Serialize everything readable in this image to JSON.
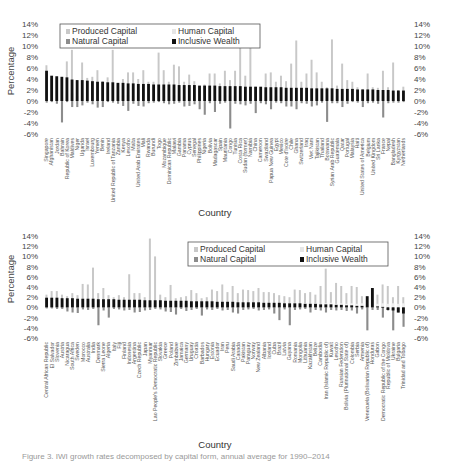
{
  "colors": {
    "produced": "#c8c8c8",
    "human": "#f0f0f0",
    "natural": "#8c8c8c",
    "inclusive": "#111111"
  },
  "legend": {
    "produced": "Produced Capital",
    "human": "Human Capital",
    "natural": "Natural Capital",
    "inclusive": "Inclusive Wealth"
  },
  "caption": "Figure 3. IWI growth rates decomposed by capital form, annual average for 1990–2014",
  "chart_data": [
    {
      "type": "bar",
      "title": "",
      "xlabel": "Country",
      "ylabel": "Percentage",
      "ylim": [
        -6,
        14
      ],
      "yticks": [
        "14%",
        "12%",
        "10%",
        "8%",
        "6%",
        "4%",
        "2%",
        "0%",
        "-2%",
        "-4%",
        "-6%"
      ],
      "legend_position": "top-center",
      "grid": false,
      "categories": [
        "Singapore",
        "Afghanistan",
        "Jordan",
        "Bahrain",
        "Republic of Korea",
        "Maldives",
        "Niger",
        "Uganda",
        "Israel",
        "Luxembourg",
        "Yemen",
        "Benin",
        "Ireland",
        "United Republic of Tanzania",
        "Zambia",
        "Kenya",
        "Lesotho",
        "Malta",
        "United Arab Emirates",
        "Mali",
        "Rwanda",
        "Burundi",
        "Togo",
        "Mozambique",
        "Dominican Republic",
        "Malawi",
        "Gambia",
        "Panama",
        "Cyprus",
        "Senegal",
        "Philippines",
        "Nigeria",
        "Bolivia",
        "Madagascar",
        "Spain",
        "Mauritania",
        "Congo",
        "Tunisia",
        "Costa Rica",
        "Sudan (former)",
        "Namibia",
        "China",
        "Cameroon",
        "Swaziland",
        "Papua New Guinea",
        "Egypt",
        "Mexico",
        "Cote d'Ivoire",
        "Chile",
        "Ghana",
        "Switzerland",
        "Iraq",
        "Viet Nam",
        "Tajikistan",
        "Thailand",
        "Botswana",
        "Syrian Arab Republic",
        "Guatemala",
        "Qatar",
        "Portugal",
        "Malaysia",
        "Haiti",
        "United States of America",
        "Belgium",
        "United Kingdom",
        "Sri Lanka",
        "France",
        "Nepal",
        "Bangladesh",
        "Kyrgyzstan",
        "Netherlands"
      ],
      "series": [
        {
          "name": "Inclusive Wealth",
          "values": [
            5.5,
            4.6,
            4.5,
            4.4,
            4.3,
            3.9,
            3.8,
            3.8,
            3.7,
            3.6,
            3.5,
            3.5,
            3.4,
            3.4,
            3.3,
            3.3,
            3.2,
            3.2,
            3.1,
            3.1,
            3.1,
            3.0,
            3.0,
            3.0,
            3.0,
            3.0,
            2.9,
            2.9,
            2.9,
            2.9,
            2.8,
            2.8,
            2.8,
            2.8,
            2.7,
            2.7,
            2.7,
            2.7,
            2.7,
            2.6,
            2.6,
            2.6,
            2.6,
            2.5,
            2.5,
            2.5,
            2.5,
            2.4,
            2.4,
            2.4,
            2.4,
            2.4,
            2.3,
            2.3,
            2.3,
            2.3,
            2.3,
            2.2,
            2.2,
            2.2,
            2.2,
            2.1,
            2.1,
            2.1,
            2.1,
            2.0,
            2.0,
            2.0,
            1.9,
            1.9,
            1.9
          ]
        },
        {
          "name": "Produced Capital",
          "values": [
            6.5,
            4.0,
            4.2,
            4.0,
            7.2,
            9.3,
            3.8,
            7.0,
            4.2,
            4.4,
            5.6,
            3.6,
            4.3,
            9.3,
            3.0,
            4.0,
            5.2,
            5.2,
            4.0,
            5.6,
            3.5,
            3.5,
            8.8,
            5.6,
            3.5,
            6.6,
            6.3,
            3.5,
            4.8,
            3.6,
            2.5,
            3.0,
            5.0,
            5.0,
            3.2,
            5.5,
            3.8,
            5.5,
            11.8,
            4.6,
            11.0,
            2.6,
            2.0,
            5.0,
            5.2,
            3.5,
            4.6,
            3.6,
            6.8,
            11.0,
            3.5,
            5.0,
            7.5,
            5.2,
            3.5,
            2.5,
            11.2,
            2.8,
            6.8,
            3.8,
            3.5,
            2.5,
            2.2,
            5.0,
            2.5,
            2.4,
            5.5,
            2.5,
            7.0,
            2.0,
            2.6
          ]
        },
        {
          "name": "Human Capital",
          "values": [
            1.0,
            0.8,
            0.9,
            0.7,
            1.2,
            1.4,
            0.9,
            1.0,
            0.8,
            1.1,
            1.0,
            0.9,
            1.3,
            0.8,
            0.9,
            1.0,
            1.1,
            0.9,
            0.8,
            1.2,
            1.0,
            0.9,
            0.8,
            1.0,
            0.9,
            1.1,
            1.0,
            0.8,
            1.0,
            0.9,
            1.0,
            1.2,
            0.9,
            0.8,
            1.0,
            1.1,
            0.9,
            1.0,
            0.8,
            1.0,
            0.9,
            1.0,
            1.0,
            0.8,
            1.0,
            0.9,
            1.0,
            1.0,
            0.9,
            1.0,
            0.9,
            1.0,
            0.8,
            1.0,
            0.9,
            1.0,
            1.0,
            0.9,
            1.0,
            0.9,
            1.0,
            0.9,
            1.0,
            0.8,
            1.0,
            0.9,
            1.0,
            0.9,
            1.0,
            0.9,
            1.0
          ]
        },
        {
          "name": "Natural Capital",
          "values": [
            -0.3,
            -0.2,
            -0.5,
            -3.9,
            -0.2,
            -1.1,
            -1.1,
            -0.8,
            -0.3,
            -0.6,
            -1.2,
            -1.1,
            -0.2,
            -0.3,
            -0.5,
            -0.9,
            -1.8,
            -0.5,
            -0.9,
            -1.0,
            -0.4,
            -0.3,
            -0.2,
            -0.4,
            -0.6,
            -0.5,
            -0.3,
            -1.0,
            -0.9,
            -0.6,
            -1.5,
            -2.5,
            -0.4,
            -2.0,
            -0.5,
            -0.3,
            -5.0,
            -0.5,
            -0.6,
            -0.8,
            -0.5,
            -2.2,
            -0.4,
            -0.6,
            -1.5,
            -0.3,
            -0.4,
            -1.0,
            -1.0,
            -1.5,
            -0.4,
            -0.5,
            -1.0,
            -0.8,
            -0.3,
            -3.8,
            -0.4,
            -0.4,
            -1.1,
            -0.5,
            -0.2,
            -0.3,
            -1.1,
            -0.4,
            -0.3,
            -0.5,
            -3.0,
            -0.4,
            -0.3,
            -0.3,
            -0.2
          ]
        }
      ]
    },
    {
      "type": "bar",
      "title": "",
      "xlabel": "Country",
      "ylabel": "Percentage",
      "ylim": [
        -6,
        14
      ],
      "yticks": [
        "14%",
        "12%",
        "10%",
        "8%",
        "6%",
        "4%",
        "2%",
        "0%",
        "-2%",
        "-4%",
        "-6%"
      ],
      "legend_position": "top-right",
      "grid": false,
      "categories": [
        "Central African Republic",
        "El Salvador",
        "Slovenia",
        "Austria",
        "Nicaragua",
        "South Africa",
        "Sweden",
        "Morocco",
        "Australia",
        "India",
        "Denmark",
        "Sierra Leone",
        "Algeria",
        "Italy",
        "Fiji",
        "Finland",
        "Indonesia",
        "Argentina",
        "Czech Republic",
        "Japan",
        "Myanmar",
        "Lao People's Democratic Republic",
        "Slovakia",
        "Greece",
        "Poland",
        "Zimbabwe",
        "Jamaica",
        "Germany",
        "Uruguay",
        "Croatia",
        "Barbados",
        "Hungary",
        "Estonia",
        "Ecuador",
        "Iran",
        "Peru",
        "Saudi Arabia",
        "Canada",
        "Pakistan",
        "Paraguay",
        "Norway",
        "New Zealand",
        "Albania",
        "Iceland",
        "Cuba",
        "Brazil",
        "Latvia",
        "Guyana",
        "Romania",
        "Mongolia",
        "Lithuania",
        "Kazakhstan",
        "Belize",
        "Cambodia",
        "Iran (Islamic Republic of)",
        "Kuwait",
        "Lesotho",
        "Russian Federation",
        "Bolivia (Plurinational State of)",
        "Colombia",
        "Serbia",
        "Armenia",
        "Venezuela (Bolivarian Republic of)",
        "Honduras",
        "Gabon",
        "Democratic Republic of the Congo",
        "Republic of Moldova",
        "Ukraine",
        "Bulgaria",
        "Trinidad and Tobago"
      ],
      "series": [
        {
          "name": "Inclusive Wealth",
          "values": [
            1.9,
            1.9,
            1.9,
            1.8,
            1.8,
            1.8,
            1.7,
            1.7,
            1.7,
            1.7,
            1.6,
            1.6,
            1.6,
            1.6,
            1.5,
            1.5,
            1.5,
            1.5,
            1.5,
            1.4,
            1.4,
            1.4,
            1.4,
            1.3,
            1.3,
            1.3,
            1.3,
            1.3,
            1.2,
            1.2,
            1.2,
            1.2,
            1.2,
            1.1,
            1.1,
            1.1,
            1.1,
            1.0,
            1.0,
            1.0,
            1.0,
            1.0,
            0.9,
            0.9,
            0.9,
            0.9,
            0.8,
            0.8,
            0.8,
            0.8,
            0.7,
            0.7,
            0.7,
            0.6,
            0.6,
            0.6,
            0.5,
            0.5,
            0.4,
            0.4,
            0.3,
            0.3,
            2.2,
            3.8,
            0.2,
            0.1,
            -0.5,
            -0.6,
            -1.0,
            -1.2
          ]
        },
        {
          "name": "Produced Capital",
          "values": [
            2.5,
            3.2,
            3.2,
            2.5,
            2.2,
            2.8,
            2.4,
            4.6,
            4.5,
            7.8,
            2.8,
            3.8,
            2.4,
            2.0,
            2.4,
            2.0,
            6.5,
            2.8,
            2.8,
            2.0,
            13.5,
            10.0,
            2.5,
            2.0,
            4.4,
            1.8,
            2.0,
            2.2,
            3.4,
            2.8,
            1.8,
            2.0,
            3.5,
            3.2,
            4.5,
            3.0,
            4.2,
            2.8,
            3.5,
            3.4,
            3.2,
            3.8,
            3.0,
            3.0,
            2.8,
            2.4,
            2.2,
            2.0,
            3.5,
            3.4,
            2.8,
            3.0,
            2.5,
            4.2,
            7.6,
            3.0,
            4.8,
            4.2,
            2.8,
            4.2,
            4.0,
            2.2,
            2.0,
            3.8,
            2.5,
            4.5,
            4.2,
            2.0,
            4.2,
            2.0
          ]
        },
        {
          "name": "Human Capital",
          "values": [
            0.8,
            0.7,
            0.8,
            0.6,
            0.9,
            0.7,
            0.8,
            0.9,
            0.7,
            0.8,
            0.6,
            0.9,
            0.7,
            0.8,
            0.7,
            0.8,
            0.9,
            0.7,
            0.8,
            0.7,
            0.9,
            0.8,
            0.7,
            0.8,
            0.7,
            0.9,
            0.8,
            0.7,
            0.8,
            0.7,
            0.8,
            0.9,
            0.7,
            0.8,
            0.7,
            0.8,
            0.9,
            0.7,
            0.8,
            0.7,
            0.8,
            0.9,
            0.7,
            0.8,
            0.7,
            0.8,
            0.7,
            0.8,
            0.9,
            0.7,
            0.8,
            0.7,
            0.8,
            0.7,
            0.8,
            0.9,
            0.7,
            0.8,
            0.7,
            0.8,
            0.7,
            0.8,
            0.7,
            0.8,
            0.7,
            0.8,
            0.7,
            0.8,
            0.7,
            0.8
          ]
        },
        {
          "name": "Natural Capital",
          "values": [
            -0.2,
            -0.2,
            -0.3,
            -0.3,
            -0.8,
            -1.0,
            -1.1,
            -0.4,
            -0.5,
            -0.3,
            -3.5,
            -0.6,
            -2.0,
            -0.3,
            -0.4,
            -0.6,
            -0.5,
            -1.0,
            -0.9,
            -0.6,
            -0.5,
            -0.3,
            -0.4,
            -0.8,
            -0.9,
            -1.4,
            -0.3,
            -0.7,
            -0.5,
            -0.3,
            -1.6,
            -0.4,
            -0.5,
            -0.3,
            -0.6,
            -0.5,
            -1.0,
            -1.2,
            -0.5,
            -0.4,
            -0.3,
            -0.6,
            -0.5,
            -0.4,
            -1.2,
            -2.5,
            -0.4,
            -3.5,
            -0.5,
            -0.4,
            -0.3,
            -1.0,
            -0.5,
            -0.6,
            -1.0,
            -0.5,
            -0.6,
            -0.5,
            -0.7,
            -0.6,
            -1.2,
            -0.4,
            -4.5,
            -0.5,
            -0.5,
            -2.0,
            -0.6,
            -4.5,
            -1.0,
            -3.8
          ]
        }
      ]
    }
  ]
}
